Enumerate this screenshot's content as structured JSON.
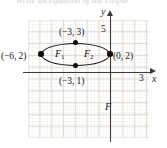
{
  "figure": {
    "title_fragment": "Write an equation of the ellipse",
    "axes": {
      "x_name": "x",
      "y_name": "y",
      "x_tick_label": "3",
      "y_tick_label": "5"
    },
    "labels": {
      "covertex_top": "(−3, 3)",
      "covertex_bottom": "(−3, 1)",
      "vertex_left": "(−6, 2)",
      "vertex_right": "(0, 2)",
      "focus_1": "F",
      "focus_1_sub": "1",
      "focus_2": "F",
      "focus_2_sub": "2",
      "focus_3": "F"
    }
  },
  "chart_data": {
    "type": "scatter",
    "xlabel": "x",
    "ylabel": "y",
    "xlim": [
      -7,
      4
    ],
    "ylim": [
      -4,
      6
    ],
    "grid": true,
    "legend": "none",
    "shapes": [
      {
        "kind": "ellipse",
        "center": [
          -3,
          2
        ],
        "semi_major_a": 3,
        "semi_minor_b": 1,
        "orientation": "horizontal"
      }
    ],
    "points": [
      {
        "label": "(−6, 2)",
        "x": -6,
        "y": 2,
        "role": "vertex"
      },
      {
        "label": "(0, 2)",
        "x": 0,
        "y": 2,
        "role": "vertex"
      },
      {
        "label": "(−3, 3)",
        "x": -3,
        "y": 3,
        "role": "co-vertex"
      },
      {
        "label": "(−3, 1)",
        "x": -3,
        "y": 1,
        "role": "co-vertex"
      }
    ],
    "annotations": [
      {
        "text": "F1",
        "x": -4.3,
        "y": 2,
        "role": "focus-label"
      },
      {
        "text": "F2",
        "x": -1.7,
        "y": 2,
        "role": "focus-label"
      },
      {
        "text": "F",
        "x": 0.1,
        "y": -2.4,
        "role": "stray-label"
      }
    ],
    "ticks": {
      "x": [
        3
      ],
      "y": [
        5
      ]
    }
  }
}
